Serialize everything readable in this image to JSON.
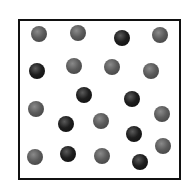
{
  "diagram": {
    "colors": {
      "gray": "#5c5c5c",
      "dark": "#1e1e1e",
      "border": "#111111"
    },
    "particles": [
      {
        "x": 39,
        "y": 34,
        "type": "gray"
      },
      {
        "x": 78,
        "y": 33,
        "type": "gray"
      },
      {
        "x": 122,
        "y": 38,
        "type": "dark"
      },
      {
        "x": 160,
        "y": 35,
        "type": "gray"
      },
      {
        "x": 37,
        "y": 71,
        "type": "dark"
      },
      {
        "x": 74,
        "y": 66,
        "type": "gray"
      },
      {
        "x": 112,
        "y": 67,
        "type": "gray"
      },
      {
        "x": 151,
        "y": 71,
        "type": "gray"
      },
      {
        "x": 36,
        "y": 109,
        "type": "gray"
      },
      {
        "x": 84,
        "y": 95,
        "type": "dark"
      },
      {
        "x": 132,
        "y": 99,
        "type": "dark"
      },
      {
        "x": 162,
        "y": 114,
        "type": "gray"
      },
      {
        "x": 66,
        "y": 124,
        "type": "dark"
      },
      {
        "x": 101,
        "y": 121,
        "type": "gray"
      },
      {
        "x": 134,
        "y": 134,
        "type": "dark"
      },
      {
        "x": 35,
        "y": 157,
        "type": "gray"
      },
      {
        "x": 68,
        "y": 154,
        "type": "dark"
      },
      {
        "x": 102,
        "y": 156,
        "type": "gray"
      },
      {
        "x": 140,
        "y": 162,
        "type": "dark"
      },
      {
        "x": 163,
        "y": 146,
        "type": "gray"
      }
    ]
  }
}
